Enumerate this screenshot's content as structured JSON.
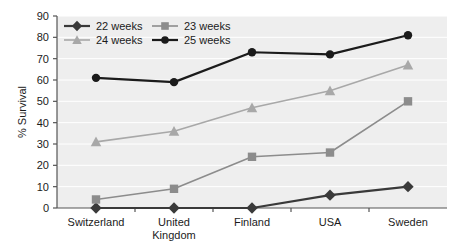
{
  "chart_data": {
    "type": "line",
    "title": "",
    "subtitle": "",
    "xlabel": "",
    "ylabel": "% Survival",
    "categories": [
      "Switzerland",
      "United Kingdom",
      "Finland",
      "USA",
      "Sweden"
    ],
    "category_lines": [
      [
        "Switzerland"
      ],
      [
        "United",
        "Kingdom"
      ],
      [
        "Finland"
      ],
      [
        "USA"
      ],
      [
        "Sweden"
      ]
    ],
    "ylim": [
      0,
      90
    ],
    "ytick_labels": [
      "0",
      "10",
      "20",
      "30",
      "40",
      "50",
      "60",
      "70",
      "80",
      "90"
    ],
    "ytick_values": [
      0,
      10,
      20,
      30,
      40,
      50,
      60,
      70,
      80,
      90
    ],
    "grid": true,
    "grid_color": "#ffffff",
    "plot_background": "#eeeeee",
    "legend_position": "top-left",
    "series": [
      {
        "name": "22 weeks",
        "marker": "diamond",
        "color": "#3a3a3a",
        "values": [
          0,
          0,
          0,
          6,
          10
        ]
      },
      {
        "name": "23 weeks",
        "marker": "square",
        "color": "#8c8c8c",
        "values": [
          4,
          9,
          24,
          26,
          50
        ]
      },
      {
        "name": "24 weeks",
        "marker": "triangle",
        "color": "#a8a8a8",
        "values": [
          31,
          36,
          47,
          55,
          67
        ]
      },
      {
        "name": "25 weeks",
        "marker": "circle",
        "color": "#1b1b1b",
        "values": [
          61,
          59,
          73,
          72,
          81
        ]
      }
    ]
  },
  "legend": {
    "items": [
      {
        "label": "22 weeks"
      },
      {
        "label": "23 weeks"
      },
      {
        "label": "24 weeks"
      },
      {
        "label": "25 weeks"
      }
    ]
  },
  "axis": {
    "y_title": "% Survival",
    "axis_color": "#555555"
  }
}
